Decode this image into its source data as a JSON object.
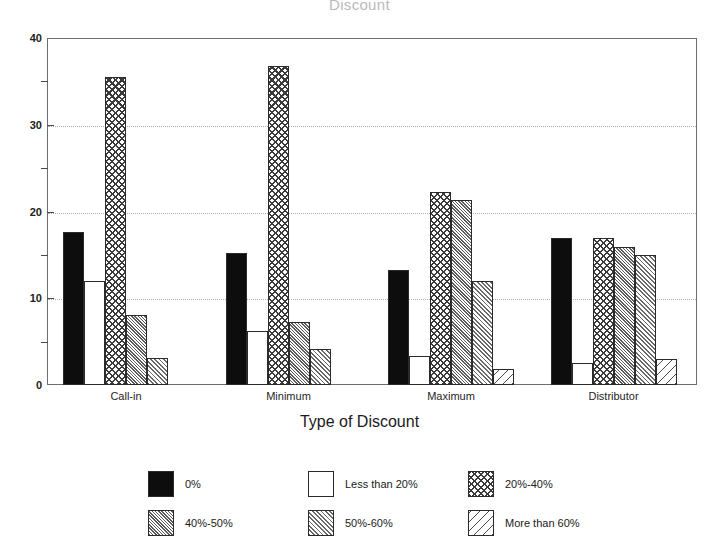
{
  "chart_data": {
    "type": "bar",
    "title": "Discount",
    "xlabel": "Type of Discount",
    "ylabel": "",
    "categories": [
      "Call-in",
      "Minimum",
      "Maximum",
      "Distributor"
    ],
    "ylim": [
      0,
      40
    ],
    "yticks": [
      0,
      10,
      20,
      30,
      40
    ],
    "yticks_minor": [
      5,
      15,
      25,
      35
    ],
    "grid": true,
    "legend_position": "bottom",
    "series": [
      {
        "name": "0%",
        "pattern": "solid",
        "values": [
          17.6,
          15.2,
          13.3,
          17.0
        ]
      },
      {
        "name": "Less than 20%",
        "pattern": "empty",
        "values": [
          12.0,
          6.2,
          3.3,
          2.5
        ]
      },
      {
        "name": "20%-40%",
        "pattern": "cross",
        "values": [
          35.5,
          36.8,
          22.3,
          17.0
        ]
      },
      {
        "name": "40%-50%",
        "pattern": "dense",
        "values": [
          8.1,
          7.3,
          21.3,
          15.9
        ]
      },
      {
        "name": "50%-60%",
        "pattern": "med",
        "values": [
          3.1,
          4.2,
          12.0,
          15.0
        ]
      },
      {
        "name": "More than 60%",
        "pattern": "sparse",
        "values": [
          0.0,
          0.0,
          1.9,
          3.0
        ]
      }
    ]
  },
  "axis": {
    "y_labels": [
      "40",
      "30",
      "20",
      "10",
      "0"
    ],
    "x_labels": [
      "Call-in",
      "Minimum",
      "Maximum",
      "Distributor"
    ],
    "x_title": "Type of Discount"
  },
  "legend": {
    "items": [
      {
        "label": "0%",
        "pattern": "solid"
      },
      {
        "label": "Less than 20%",
        "pattern": "empty"
      },
      {
        "label": "20%-40%",
        "pattern": "cross"
      },
      {
        "label": "40%-50%",
        "pattern": "dense"
      },
      {
        "label": "50%-60%",
        "pattern": "med"
      },
      {
        "label": "More than 60%",
        "pattern": "sparse"
      }
    ]
  },
  "colors": {
    "ink": "#1a1a1a",
    "frame": "#6d6d6d",
    "grid": "#b0b0b0",
    "bar_solid": "#0d0d0d",
    "background": "#ffffff"
  }
}
